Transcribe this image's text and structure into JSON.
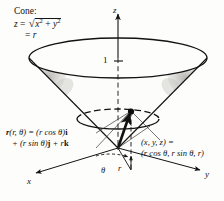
{
  "figure": {
    "background_color": "#fdfdfb",
    "ink_color": "#121212",
    "shade_color": "#b4b2ad"
  },
  "caption": {
    "heading": "Cone:",
    "equation_lhs": "z",
    "equals": "=",
    "radical_symbol": "√",
    "radicand_x": "x",
    "radicand_exp": "2",
    "radicand_plus": "+",
    "radicand_y": "y",
    "radicand_y_exp": "2",
    "second_line_equals": "=",
    "second_line_value": "r"
  },
  "axes": {
    "z_label": "z",
    "x_label": "x",
    "y_label": "y",
    "z_tick_value": "1",
    "theta_label": "θ",
    "r_label": "r"
  },
  "vector_equation": {
    "line1_fn": "r",
    "line1_args": "(r, θ) = (r cos θ)",
    "line1_basis": "i",
    "line2_lead": "+ (r sin θ)",
    "line2_basis_j": "j",
    "line2_plus_r": " + r",
    "line2_basis_k": "k"
  },
  "point_label": {
    "line1": "(x, y, z) =",
    "line2": "(r cos θ, r sin θ, r)"
  },
  "geometry": {
    "apex": [
      118,
      148
    ],
    "z_axis_top": [
      118,
      14
    ],
    "top_ellipse_center": [
      118,
      58
    ],
    "top_ellipse_rx": 89,
    "top_ellipse_ry": 20,
    "inner_ellipse_center": [
      118,
      119
    ],
    "inner_ellipse_rx": 41,
    "inner_ellipse_ry": 10,
    "point_on_circle": [
      131,
      111
    ],
    "x_axis_end": [
      36,
      173
    ],
    "y_axis_end": [
      200,
      170
    ]
  }
}
